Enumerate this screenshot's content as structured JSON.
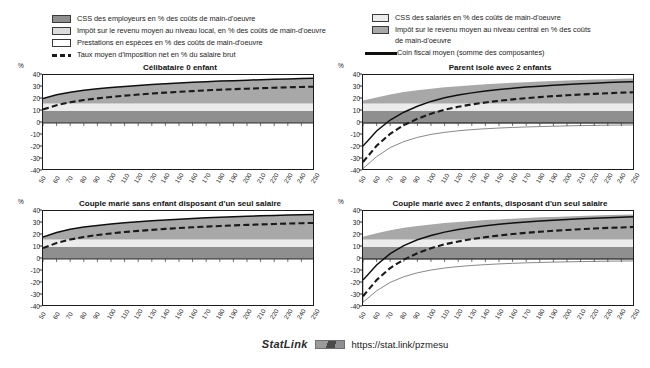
{
  "figure": {
    "unit_label": "%",
    "statlink": {
      "word": "StatLink",
      "badge_icon": "statlink-barcode-icon",
      "url": "https://stat.link/pzmesu"
    }
  },
  "legend_left": {
    "items": [
      {
        "icon": "color-swatch-dark-gray",
        "label": "CSS des employeurs en % des coûts de main-d'oeuvre",
        "color": "#8f8f8f"
      },
      {
        "icon": "color-swatch-light-gray",
        "label": "Impôt sur le revenu moyen au niveau local, en % des coûts de main-d'oeuvre",
        "color": "#dcdcdc"
      },
      {
        "icon": "color-swatch-white",
        "label": "Prestations en espèces en % des coûts de main-d'oeuvre",
        "color": "#ffffff"
      },
      {
        "icon": "dashed-line-swatch",
        "label": "Taux moyen d'imposition net en % du salaire brut",
        "color": "#1a1a1a"
      }
    ]
  },
  "legend_right": {
    "items": [
      {
        "icon": "color-swatch-very-light-gray",
        "label": "CSS des salariés en % des coûts de main-d'oeuvre",
        "color": "#ececec"
      },
      {
        "icon": "color-swatch-medium-gray",
        "label": "Impôt sur le revenu moyen au niveau central en %  des coûts\nde main-d'oeuvre",
        "color": "#a8a8a8"
      },
      {
        "icon": "solid-line-swatch",
        "label": "Coin fiscal moyen (somme des composantes)",
        "color": "#101010"
      }
    ]
  },
  "chart_data": {
    "type": "area",
    "xlabel": "",
    "ylabel": "%",
    "grid": false,
    "legend_position": "top",
    "xlim": [
      50,
      250
    ],
    "ylim": [
      -40,
      40
    ],
    "yticks": [
      40,
      30,
      20,
      10,
      0,
      -10,
      -20,
      -30,
      -40
    ],
    "x": [
      50,
      60,
      70,
      80,
      90,
      100,
      110,
      120,
      130,
      140,
      150,
      160,
      170,
      180,
      190,
      200,
      210,
      220,
      230,
      240,
      250
    ],
    "xticks": [
      "50",
      "60",
      "70",
      "80",
      "90",
      "100",
      "110",
      "120",
      "130",
      "140",
      "150",
      "160",
      "170",
      "180",
      "190",
      "200",
      "210",
      "220",
      "230",
      "240",
      "250"
    ],
    "panels": [
      {
        "title": "Célibataire 0 enfant",
        "series": [
          {
            "name": "CSS des employeurs en % des coûts de main-d'oeuvre",
            "fill": "#8f8f8f",
            "stack": "positive",
            "values": [
              10.2,
              10.2,
              10.2,
              10.2,
              10.2,
              10.2,
              10.2,
              10.2,
              10.2,
              10.2,
              10.2,
              10.2,
              10.2,
              10.2,
              10.2,
              10.2,
              10.2,
              10.2,
              10.2,
              10.2,
              10.2
            ]
          },
          {
            "name": "CSS des salariés en % des coûts de main-d'oeuvre",
            "fill": "#ececec",
            "stack": "positive",
            "values": [
              6.1,
              6.1,
              6.1,
              6.1,
              6.1,
              6.1,
              6.1,
              6.1,
              6.1,
              6.1,
              6.1,
              6.1,
              6.1,
              6.1,
              6.1,
              6.1,
              6.1,
              6.1,
              6.1,
              6.1,
              6.1
            ]
          },
          {
            "name": "Impôt sur le revenu moyen au niveau central en %  des coûts de main-d'oeuvre",
            "fill": "#a8a8a8",
            "stack": "positive",
            "values": [
              4.0,
              7.2,
              9.4,
              11.0,
              12.2,
              13.2,
              14.2,
              15.0,
              15.8,
              16.4,
              17.0,
              17.6,
              18.1,
              18.6,
              19.0,
              19.4,
              19.8,
              20.1,
              20.4,
              20.7,
              21.0
            ]
          },
          {
            "name": "Impôt sur le revenu moyen au niveau local, en % des coûts de main-d'oeuvre",
            "fill": "#dcdcdc",
            "stack": "positive",
            "values": [
              0,
              0,
              0,
              0,
              0,
              0,
              0,
              0,
              0,
              0,
              0,
              0,
              0,
              0,
              0,
              0,
              0,
              0,
              0,
              0,
              0
            ]
          },
          {
            "name": "Prestations en espèces en % des coûts de main-d'oeuvre",
            "fill": "#ffffff",
            "stack": "negative",
            "values": [
              0,
              0,
              0,
              0,
              0,
              0,
              0,
              0,
              0,
              0,
              0,
              0,
              0,
              0,
              0,
              0,
              0,
              0,
              0,
              0,
              0
            ]
          }
        ],
        "lines": [
          {
            "name": "Coin fiscal moyen (somme des composantes)",
            "style": "solid",
            "color": "#101010",
            "values": [
              20.3,
              23.5,
              25.7,
              27.3,
              28.5,
              29.5,
              30.5,
              31.3,
              32.1,
              32.7,
              33.3,
              33.9,
              34.4,
              34.9,
              35.3,
              35.7,
              36.1,
              36.4,
              36.7,
              37.0,
              37.3
            ]
          },
          {
            "name": "Taux moyen d'imposition net en % du salaire brut",
            "style": "dashed",
            "color": "#1a1a1a",
            "values": [
              11.3,
              14.8,
              17.3,
              19.1,
              20.5,
              21.7,
              22.8,
              23.7,
              24.6,
              25.3,
              26.0,
              26.6,
              27.2,
              27.7,
              28.2,
              28.6,
              29.0,
              29.4,
              29.7,
              30.0,
              30.3
            ]
          }
        ]
      },
      {
        "title": "Parent isolé avec 2 enfants",
        "series": [
          {
            "name": "CSS des employeurs en % des coûts de main-d'oeuvre",
            "fill": "#8f8f8f",
            "stack": "positive",
            "values": [
              10.2,
              10.2,
              10.2,
              10.2,
              10.2,
              10.2,
              10.2,
              10.2,
              10.2,
              10.2,
              10.2,
              10.2,
              10.2,
              10.2,
              10.2,
              10.2,
              10.2,
              10.2,
              10.2,
              10.2,
              10.2
            ]
          },
          {
            "name": "CSS des salariés en % des coûts de main-d'oeuvre",
            "fill": "#ececec",
            "stack": "positive",
            "values": [
              6.1,
              6.1,
              6.1,
              6.1,
              6.1,
              6.1,
              6.1,
              6.1,
              6.1,
              6.1,
              6.1,
              6.1,
              6.1,
              6.1,
              6.1,
              6.1,
              6.1,
              6.1,
              6.1,
              6.1,
              6.1
            ]
          },
          {
            "name": "Impôt sur le revenu moyen au niveau central en %  des coûts de main-d'oeuvre",
            "fill": "#a8a8a8",
            "stack": "positive",
            "values": [
              2.5,
              5.0,
              7.5,
              9.5,
              11.0,
              12.3,
              13.4,
              14.3,
              15.1,
              15.9,
              16.6,
              17.2,
              17.7,
              18.2,
              18.7,
              19.1,
              19.5,
              19.9,
              20.2,
              20.5,
              20.8
            ]
          },
          {
            "name": "Impôt sur le revenu moyen au niveau local, en % des coûts de main-d'oeuvre",
            "fill": "#dcdcdc",
            "stack": "positive",
            "values": [
              0,
              0,
              0,
              0,
              0,
              0,
              0,
              0,
              0,
              0,
              0,
              0,
              0,
              0,
              0,
              0,
              0,
              0,
              0,
              0,
              0
            ]
          },
          {
            "name": "Prestations en espèces en % des coûts de main-d'oeuvre",
            "fill": "#ffffff",
            "stack": "negative",
            "values": [
              -38.0,
              -28.0,
              -20.5,
              -15.5,
              -12.0,
              -9.5,
              -7.8,
              -6.5,
              -5.5,
              -4.8,
              -4.2,
              -3.7,
              -3.3,
              -3.0,
              -2.7,
              -2.4,
              -2.2,
              -2.0,
              -1.8,
              -1.7,
              -1.6
            ]
          }
        ],
        "lines": [
          {
            "name": "Coin fiscal moyen (somme des composantes)",
            "style": "solid",
            "color": "#101010",
            "values": [
              -19.2,
              -6.7,
              2.5,
              9.0,
              14.0,
              18.0,
              21.0,
              23.3,
              25.1,
              26.6,
              27.9,
              29.0,
              29.9,
              30.7,
              31.4,
              32.1,
              32.7,
              33.2,
              33.7,
              34.1,
              34.5
            ]
          },
          {
            "name": "Taux moyen d'imposition net en % du salaire brut",
            "style": "dashed",
            "color": "#1a1a1a",
            "values": [
              -32.5,
              -19.0,
              -9.0,
              -1.8,
              3.5,
              7.8,
              11.0,
              13.5,
              15.5,
              17.1,
              18.5,
              19.7,
              20.7,
              21.6,
              22.4,
              23.1,
              23.7,
              24.3,
              24.8,
              25.3,
              25.7
            ]
          }
        ]
      },
      {
        "title": "Couple marié sans enfant disposant d'un seul salaire",
        "series": [
          {
            "name": "CSS des employeurs en % des coûts de main-d'oeuvre",
            "fill": "#8f8f8f",
            "stack": "positive",
            "values": [
              10.2,
              10.2,
              10.2,
              10.2,
              10.2,
              10.2,
              10.2,
              10.2,
              10.2,
              10.2,
              10.2,
              10.2,
              10.2,
              10.2,
              10.2,
              10.2,
              10.2,
              10.2,
              10.2,
              10.2,
              10.2
            ]
          },
          {
            "name": "CSS des salariés en % des coûts de main-d'oeuvre",
            "fill": "#ececec",
            "stack": "positive",
            "values": [
              6.1,
              6.1,
              6.1,
              6.1,
              6.1,
              6.1,
              6.1,
              6.1,
              6.1,
              6.1,
              6.1,
              6.1,
              6.1,
              6.1,
              6.1,
              6.1,
              6.1,
              6.1,
              6.1,
              6.1,
              6.1
            ]
          },
          {
            "name": "Impôt sur le revenu moyen au niveau central en %  des coûts de main-d'oeuvre",
            "fill": "#a8a8a8",
            "stack": "positive",
            "values": [
              2.0,
              5.8,
              8.4,
              10.3,
              11.7,
              12.9,
              13.9,
              14.8,
              15.6,
              16.3,
              16.9,
              17.5,
              18.0,
              18.5,
              18.9,
              19.3,
              19.7,
              20.0,
              20.3,
              20.6,
              20.9
            ]
          },
          {
            "name": "Impôt sur le revenu moyen au niveau local, en % des coûts de main-d'oeuvre",
            "fill": "#dcdcdc",
            "stack": "positive",
            "values": [
              0,
              0,
              0,
              0,
              0,
              0,
              0,
              0,
              0,
              0,
              0,
              0,
              0,
              0,
              0,
              0,
              0,
              0,
              0,
              0,
              0
            ]
          },
          {
            "name": "Prestations en espèces en % des coûts de main-d'oeuvre",
            "fill": "#ffffff",
            "stack": "negative",
            "values": [
              0,
              0,
              0,
              0,
              0,
              0,
              0,
              0,
              0,
              0,
              0,
              0,
              0,
              0,
              0,
              0,
              0,
              0,
              0,
              0,
              0
            ]
          }
        ],
        "lines": [
          {
            "name": "Coin fiscal moyen (somme des composantes)",
            "style": "solid",
            "color": "#101010",
            "values": [
              18.3,
              22.1,
              24.7,
              26.6,
              28.0,
              29.2,
              30.2,
              31.1,
              31.9,
              32.6,
              33.2,
              33.8,
              34.3,
              34.8,
              35.2,
              35.6,
              36.0,
              36.3,
              36.6,
              36.9,
              37.2
            ]
          },
          {
            "name": "Taux moyen d'imposition net en % du salaire brut",
            "style": "dashed",
            "color": "#1a1a1a",
            "values": [
              9.1,
              13.3,
              16.2,
              18.4,
              20.0,
              21.3,
              22.5,
              23.4,
              24.3,
              25.1,
              25.8,
              26.4,
              27.0,
              27.5,
              28.0,
              28.4,
              28.8,
              29.2,
              29.5,
              29.8,
              30.1
            ]
          }
        ]
      },
      {
        "title": "Couple marié avec 2 enfants, disposant d'un seul salaire",
        "series": [
          {
            "name": "CSS des employeurs en % des coûts de main-d'oeuvre",
            "fill": "#8f8f8f",
            "stack": "positive",
            "values": [
              10.2,
              10.2,
              10.2,
              10.2,
              10.2,
              10.2,
              10.2,
              10.2,
              10.2,
              10.2,
              10.2,
              10.2,
              10.2,
              10.2,
              10.2,
              10.2,
              10.2,
              10.2,
              10.2,
              10.2,
              10.2
            ]
          },
          {
            "name": "CSS des salariés en % des coûts de main-d'oeuvre",
            "fill": "#ececec",
            "stack": "positive",
            "values": [
              6.1,
              6.1,
              6.1,
              6.1,
              6.1,
              6.1,
              6.1,
              6.1,
              6.1,
              6.1,
              6.1,
              6.1,
              6.1,
              6.1,
              6.1,
              6.1,
              6.1,
              6.1,
              6.1,
              6.1,
              6.1
            ]
          },
          {
            "name": "Impôt sur le revenu moyen au niveau central en %  des coûts de main-d'oeuvre",
            "fill": "#a8a8a8",
            "stack": "positive",
            "values": [
              2.2,
              5.2,
              7.7,
              9.7,
              11.2,
              12.5,
              13.6,
              14.5,
              15.3,
              16.1,
              16.7,
              17.3,
              17.9,
              18.4,
              18.8,
              19.2,
              19.6,
              20.0,
              20.3,
              20.6,
              20.9
            ]
          },
          {
            "name": "Impôt sur le revenu moyen au niveau local, en % des coûts de main-d'oeuvre",
            "fill": "#dcdcdc",
            "stack": "positive",
            "values": [
              0,
              0,
              0,
              0,
              0,
              0,
              0,
              0,
              0,
              0,
              0,
              0,
              0,
              0,
              0,
              0,
              0,
              0,
              0,
              0,
              0
            ]
          },
          {
            "name": "Prestations en espèces en % des coûts de main-d'oeuvre",
            "fill": "#ffffff",
            "stack": "negative",
            "values": [
              -36.0,
              -26.5,
              -19.5,
              -14.8,
              -11.5,
              -9.2,
              -7.5,
              -6.3,
              -5.4,
              -4.7,
              -4.1,
              -3.6,
              -3.2,
              -2.9,
              -2.6,
              -2.4,
              -2.2,
              -2.0,
              -1.8,
              -1.7,
              -1.6
            ]
          }
        ],
        "lines": [
          {
            "name": "Coin fiscal moyen (somme des composantes)",
            "style": "solid",
            "color": "#101010",
            "values": [
              -17.5,
              -5.0,
              4.5,
              11.2,
              16.0,
              19.6,
              22.4,
              24.5,
              26.2,
              27.7,
              28.9,
              29.9,
              30.8,
              31.6,
              32.3,
              32.9,
              33.5,
              34.0,
              34.4,
              34.8,
              35.2
            ]
          },
          {
            "name": "Taux moyen d'imposition net en % du salaire brut",
            "style": "dashed",
            "color": "#1a1a1a",
            "values": [
              -31.0,
              -17.5,
              -7.5,
              -0.5,
              4.8,
              9.0,
              12.2,
              14.6,
              16.6,
              18.2,
              19.6,
              20.8,
              21.8,
              22.7,
              23.5,
              24.2,
              24.8,
              25.4,
              25.9,
              26.3,
              26.7
            ]
          }
        ]
      }
    ]
  }
}
